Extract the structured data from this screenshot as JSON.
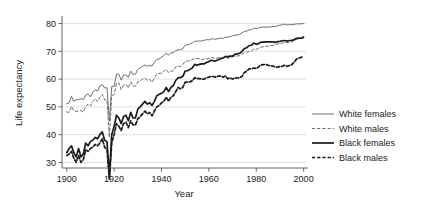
{
  "chart_data": {
    "type": "line",
    "title": "",
    "xlabel": "Year",
    "ylabel": "Life expectancy",
    "xlim": [
      1898,
      2001
    ],
    "ylim": [
      28,
      82
    ],
    "xticks": [
      1900,
      1920,
      1940,
      1960,
      1980,
      2000
    ],
    "xticklabels": [
      "1900",
      "1920",
      "1940",
      "1960",
      "1980",
      "2000"
    ],
    "yticks": [
      30,
      40,
      50,
      60,
      70,
      80
    ],
    "yticklabels": [
      "30",
      "40",
      "50",
      "60",
      "70",
      "80"
    ],
    "grid": "horizontal",
    "legend_position": "right",
    "x": [
      1900,
      1901,
      1902,
      1903,
      1904,
      1905,
      1906,
      1907,
      1908,
      1909,
      1910,
      1911,
      1912,
      1913,
      1914,
      1915,
      1916,
      1917,
      1918,
      1919,
      1920,
      1921,
      1922,
      1923,
      1924,
      1925,
      1926,
      1927,
      1928,
      1929,
      1930,
      1931,
      1932,
      1933,
      1934,
      1935,
      1936,
      1937,
      1938,
      1939,
      1940,
      1941,
      1942,
      1943,
      1944,
      1945,
      1946,
      1947,
      1948,
      1949,
      1950,
      1951,
      1952,
      1953,
      1954,
      1955,
      1956,
      1957,
      1958,
      1959,
      1960,
      1961,
      1962,
      1963,
      1964,
      1965,
      1966,
      1967,
      1968,
      1969,
      1970,
      1971,
      1972,
      1973,
      1974,
      1975,
      1976,
      1977,
      1978,
      1979,
      1980,
      1981,
      1982,
      1983,
      1984,
      1985,
      1986,
      1987,
      1988,
      1989,
      1990,
      1991,
      1992,
      1993,
      1994,
      1995,
      1996,
      1997,
      1998,
      1999,
      2000
    ],
    "series": [
      {
        "name": "White females",
        "style": "solid",
        "color": "#6e6e6e",
        "width": 1.0,
        "values": [
          51.1,
          51.4,
          53.8,
          52.0,
          52.6,
          52.6,
          53.0,
          52.6,
          54.2,
          54.6,
          53.6,
          55.3,
          56.2,
          55.7,
          57.5,
          58.0,
          56.8,
          56.9,
          44.9,
          57.4,
          57.4,
          61.8,
          61.8,
          59.6,
          61.5,
          61.5,
          60.6,
          62.9,
          61.7,
          61.8,
          63.5,
          64.1,
          64.6,
          65.1,
          64.6,
          65.0,
          64.7,
          66.1,
          67.1,
          67.3,
          67.9,
          68.5,
          69.4,
          68.6,
          69.5,
          69.5,
          70.3,
          70.5,
          70.6,
          71.0,
          72.2,
          72.4,
          72.6,
          73.0,
          73.6,
          73.7,
          73.7,
          73.7,
          74.0,
          74.2,
          74.1,
          74.5,
          74.4,
          74.4,
          74.6,
          74.7,
          74.7,
          75.1,
          75.1,
          75.3,
          75.6,
          75.8,
          75.9,
          76.1,
          76.7,
          77.2,
          77.3,
          77.7,
          77.8,
          78.4,
          78.1,
          78.4,
          78.7,
          78.7,
          78.7,
          78.7,
          78.8,
          78.9,
          78.9,
          79.2,
          79.4,
          79.6,
          79.8,
          79.5,
          79.6,
          79.6,
          79.7,
          79.9,
          79.9,
          79.9,
          80.0
        ]
      },
      {
        "name": "White males",
        "style": "dashed",
        "color": "#6e6e6e",
        "width": 1.0,
        "values": [
          48.2,
          48.0,
          50.2,
          48.6,
          48.3,
          48.6,
          48.7,
          48.1,
          50.2,
          51.0,
          50.3,
          52.0,
          52.9,
          51.9,
          53.5,
          54.5,
          52.5,
          52.4,
          39.1,
          54.1,
          54.4,
          58.5,
          58.7,
          56.2,
          57.9,
          58.0,
          56.8,
          59.0,
          57.6,
          57.4,
          59.1,
          59.4,
          60.0,
          60.4,
          59.6,
          59.9,
          58.8,
          60.3,
          61.9,
          62.1,
          62.1,
          62.8,
          63.5,
          62.4,
          62.9,
          62.9,
          64.4,
          64.6,
          64.6,
          65.2,
          66.5,
          66.5,
          66.6,
          67.0,
          67.4,
          67.4,
          67.3,
          67.0,
          67.2,
          67.3,
          67.4,
          67.8,
          67.6,
          67.5,
          67.7,
          67.6,
          67.6,
          67.8,
          67.5,
          67.8,
          68.0,
          68.3,
          68.3,
          68.5,
          69.0,
          69.5,
          69.7,
          70.0,
          70.2,
          70.8,
          70.7,
          71.1,
          71.5,
          71.7,
          71.8,
          71.9,
          72.0,
          72.2,
          72.3,
          72.7,
          72.7,
          73.0,
          73.2,
          73.1,
          73.3,
          73.4,
          73.9,
          74.3,
          74.5,
          74.6,
          74.8
        ]
      },
      {
        "name": "Black females",
        "style": "solid",
        "color": "#1a1a1a",
        "width": 1.7,
        "values": [
          33.5,
          35.0,
          36.0,
          33.5,
          32.0,
          35.0,
          32.0,
          33.0,
          37.0,
          36.0,
          37.5,
          38.0,
          39.0,
          38.5,
          40.0,
          41.0,
          38.0,
          37.5,
          25.0,
          40.0,
          43.0,
          47.0,
          46.0,
          44.0,
          46.5,
          47.0,
          45.0,
          48.0,
          46.0,
          46.0,
          49.2,
          50.0,
          51.0,
          52.0,
          51.0,
          51.5,
          50.5,
          52.0,
          54.0,
          54.5,
          54.9,
          55.5,
          57.0,
          55.5,
          57.0,
          57.7,
          59.5,
          60.5,
          60.5,
          61.0,
          62.9,
          63.0,
          63.5,
          64.0,
          65.3,
          65.0,
          65.3,
          65.5,
          65.5,
          66.0,
          66.3,
          66.8,
          66.6,
          66.6,
          67.0,
          67.4,
          67.6,
          68.2,
          68.0,
          68.3,
          68.3,
          68.9,
          69.1,
          69.3,
          70.0,
          71.0,
          71.3,
          72.1,
          72.2,
          73.0,
          72.5,
          72.8,
          73.3,
          73.3,
          73.4,
          73.4,
          73.4,
          73.4,
          73.2,
          73.5,
          73.6,
          73.8,
          73.9,
          73.7,
          73.9,
          73.9,
          74.2,
          74.7,
          74.8,
          74.7,
          75.2
        ]
      },
      {
        "name": "Black males",
        "style": "dashed",
        "color": "#1a1a1a",
        "width": 1.7,
        "values": [
          32.5,
          33.0,
          34.0,
          31.5,
          30.0,
          32.5,
          30.0,
          31.0,
          34.5,
          34.0,
          35.0,
          35.5,
          36.5,
          36.0,
          37.0,
          38.5,
          35.5,
          34.5,
          24.0,
          37.0,
          40.0,
          44.0,
          43.0,
          41.5,
          44.0,
          44.5,
          42.5,
          45.0,
          43.5,
          43.5,
          45.7,
          46.5,
          47.5,
          48.5,
          47.5,
          48.0,
          46.8,
          48.5,
          50.0,
          50.5,
          51.5,
          52.0,
          53.5,
          52.0,
          53.5,
          54.0,
          55.5,
          57.0,
          56.5,
          57.0,
          58.9,
          58.9,
          59.0,
          59.4,
          60.5,
          60.2,
          60.2,
          60.0,
          60.0,
          60.5,
          60.7,
          61.0,
          60.9,
          60.7,
          61.1,
          61.1,
          60.7,
          61.1,
          60.1,
          60.5,
          60.0,
          60.5,
          60.4,
          60.5,
          61.0,
          62.4,
          62.9,
          63.7,
          63.7,
          64.0,
          63.8,
          64.4,
          65.1,
          65.2,
          65.3,
          65.0,
          64.8,
          64.7,
          64.4,
          64.3,
          64.5,
          64.6,
          65.0,
          64.6,
          64.9,
          65.2,
          66.1,
          67.2,
          67.6,
          67.8,
          68.3
        ]
      }
    ]
  },
  "legend": {
    "entries": [
      {
        "label": "White females"
      },
      {
        "label": "White males"
      },
      {
        "label": "Black females"
      },
      {
        "label": "Black males"
      }
    ]
  }
}
